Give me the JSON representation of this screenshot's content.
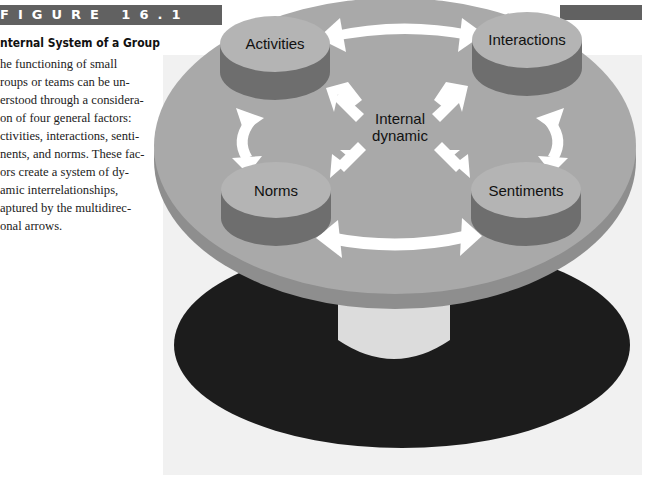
{
  "figure": {
    "label": "FIGURE 16.1",
    "title": "nternal System of a Group",
    "caption_lines": [
      "he functioning of small",
      "roups or teams can be un-",
      "erstood through a considera-",
      "on of four general factors:",
      "ctivities, interactions, senti-",
      "nents, and norms. These fac-",
      "ors create a system of dy-",
      "amic interrelationships,",
      "aptured by the multidirec-",
      "onal arrows."
    ]
  },
  "diagram": {
    "center_label_line1": "Internal",
    "center_label_line2": "dynamic",
    "nodes": [
      {
        "id": "activities",
        "label": "Activities"
      },
      {
        "id": "interactions",
        "label": "Interactions"
      },
      {
        "id": "norms",
        "label": "Norms"
      },
      {
        "id": "sentiments",
        "label": "Sentiments"
      }
    ],
    "colors": {
      "panel": "#f1f1f1",
      "table_top": "#a9a9a9",
      "table_rim": "#8e8e8e",
      "node_top": "#b4b4b4",
      "node_side": "#6e6e6e",
      "shadow": "#1c1c1c",
      "pedestal": "#dcdcdc",
      "arrow": "#ffffff",
      "figure_bar": "#616161"
    }
  }
}
